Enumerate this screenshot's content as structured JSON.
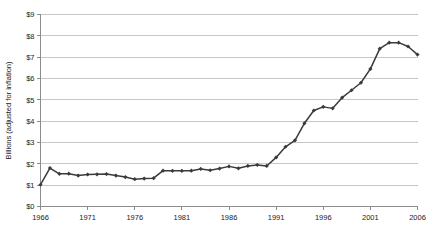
{
  "chart_data": {
    "type": "line",
    "title": "",
    "xlabel": "",
    "ylabel": "Billions (adjusted for inflation)",
    "xlim": [
      1966,
      2006
    ],
    "ylim": [
      0,
      9
    ],
    "grid": true,
    "legend": "none",
    "x_tick_labels": [
      "1966",
      "1971",
      "1976",
      "1981",
      "1986",
      "1991",
      "1996",
      "2001",
      "2006"
    ],
    "x_ticks": [
      1966,
      1971,
      1976,
      1981,
      1986,
      1991,
      1996,
      2001,
      2006
    ],
    "y_tick_labels": [
      "$0",
      "$1",
      "$2",
      "$3",
      "$4",
      "$5",
      "$6",
      "$7",
      "$8",
      "$9"
    ],
    "y_ticks": [
      0,
      1,
      2,
      3,
      4,
      5,
      6,
      7,
      8,
      9
    ],
    "series": [
      {
        "name": "Billions (adjusted for inflation)",
        "color": "#3b3b3b",
        "marker": "diamond",
        "x": [
          1966,
          1967,
          1968,
          1969,
          1970,
          1971,
          1972,
          1973,
          1974,
          1975,
          1976,
          1977,
          1978,
          1979,
          1980,
          1981,
          1982,
          1983,
          1984,
          1985,
          1986,
          1987,
          1988,
          1989,
          1990,
          1991,
          1992,
          1993,
          1994,
          1995,
          1996,
          1997,
          1998,
          1999,
          2000,
          2001,
          2002,
          2003,
          2004,
          2005,
          2006
        ],
        "values": [
          1.02,
          1.8,
          1.53,
          1.54,
          1.45,
          1.5,
          1.51,
          1.52,
          1.45,
          1.38,
          1.28,
          1.31,
          1.33,
          1.68,
          1.67,
          1.67,
          1.68,
          1.76,
          1.7,
          1.78,
          1.88,
          1.79,
          1.9,
          1.95,
          1.9,
          2.3,
          2.8,
          3.1,
          3.9,
          4.5,
          4.67,
          4.6,
          5.1,
          5.45,
          5.8,
          6.45,
          7.4,
          7.68,
          7.68,
          7.5,
          7.12
        ]
      }
    ]
  }
}
